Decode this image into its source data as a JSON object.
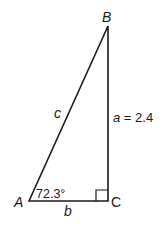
{
  "diagram": {
    "type": "right-triangle",
    "vertices": {
      "A": {
        "label": "A"
      },
      "B": {
        "label": "B"
      },
      "C": {
        "label": "C"
      }
    },
    "sides": {
      "a": {
        "label": "a = 2.4",
        "var": "a",
        "value": "2.4"
      },
      "b": {
        "label": "b"
      },
      "c": {
        "label": "c"
      }
    },
    "angle_A": {
      "label": "72.3°"
    },
    "right_angle_at": "C",
    "colors": {
      "stroke": "#1a1a1a",
      "background": "#ffffff"
    }
  }
}
